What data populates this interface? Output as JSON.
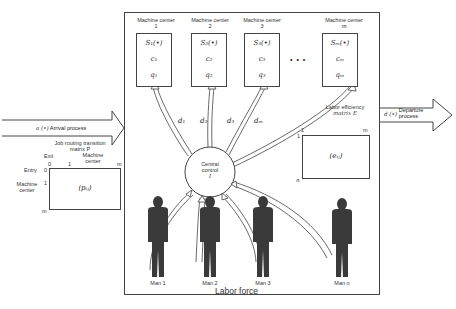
{
  "machine_centers": [
    {
      "title": "Machine center",
      "index": "1",
      "s": "S₁(•)",
      "c": "c₁",
      "q": "q₁",
      "d": "d₁"
    },
    {
      "title": "Machine center",
      "index": "2",
      "s": "S₂(•)",
      "c": "c₂",
      "q": "q₂",
      "d": "d₂"
    },
    {
      "title": "Machine center",
      "index": "3",
      "s": "S₃(•)",
      "c": "c₃",
      "q": "q₃",
      "d": "d₃"
    },
    {
      "title": "Machine center",
      "index": "m",
      "s": "Sₘ(•)",
      "c": "cₘ",
      "q": "qₘ",
      "d": "dₘ"
    }
  ],
  "ellipsis": "• • •",
  "central_control": {
    "line1": "Central",
    "line2": "control",
    "symbol": "I"
  },
  "arrival": {
    "symbol": "a (•)",
    "label": "Arrival process"
  },
  "departure": {
    "symbol": "d (•)",
    "label1": "Departure",
    "label2": "process"
  },
  "routing_matrix": {
    "title1": "Job routing transition",
    "title2": "matrix P",
    "exit_label": "Exit",
    "machine_center_label1": "Machine",
    "machine_center_label2": "center",
    "col_ticks": [
      "0",
      "1",
      "m"
    ],
    "entry_label": "Entry",
    "row_ticks": [
      "0",
      "1",
      "m"
    ],
    "row_label1": "Machine",
    "row_label2": "center",
    "cell": "(pᵢⱼ)"
  },
  "efficiency_matrix": {
    "title1": "Labor efficiency",
    "title2": "matrix E",
    "col_ticks": [
      "1",
      "m"
    ],
    "row_ticks": [
      "1",
      "n"
    ],
    "cell": "(eᵢⱼ)"
  },
  "workers": [
    {
      "label": "Man 1"
    },
    {
      "label": "Man 2"
    },
    {
      "label": "Man 3"
    },
    {
      "label": "Man n"
    }
  ],
  "labor_force_label": "Labor force",
  "colors": {
    "line": "#444444",
    "figure": "#3a3a3a",
    "background": "#ffffff"
  }
}
